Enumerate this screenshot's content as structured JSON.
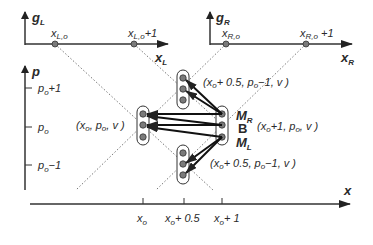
{
  "top_left_axes": {
    "y_label": "g",
    "y_sub": "L",
    "x_label": "x",
    "x_sub": "L",
    "points": [
      {
        "label": "x",
        "sub": "L,o",
        "suffix": ""
      },
      {
        "label": "x",
        "sub": "L,o",
        "suffix": "+1"
      }
    ]
  },
  "top_right_axes": {
    "y_label": "g",
    "y_sub": "R",
    "x_label": "x",
    "x_sub": "R",
    "points": [
      {
        "label": "x",
        "sub": "R,o",
        "suffix": ""
      },
      {
        "label": "x",
        "sub": "R,o",
        "suffix": " +1"
      }
    ]
  },
  "main_axes": {
    "y_label": "p",
    "x_label": "x",
    "y_ticks": [
      {
        "base": "p",
        "sub": "o",
        "suffix": "+1"
      },
      {
        "base": "p",
        "sub": "o",
        "suffix": ""
      },
      {
        "base": "p",
        "sub": "o",
        "suffix": "−1"
      }
    ],
    "x_ticks": [
      {
        "base": "x",
        "sub": "o",
        "suffix": ""
      },
      {
        "base": "x",
        "sub": "o",
        "suffix": "+ 0.5"
      },
      {
        "base": "x",
        "sub": "o",
        "suffix": "+ 1"
      }
    ]
  },
  "nodes": {
    "left": {
      "label_pre": "(x",
      "sub": "o",
      "label_mid": ", p",
      "sub2": "o",
      "label_post": ", v )"
    },
    "upper": {
      "label_pre": "(x",
      "sub": "o",
      "label_mid": "+ 0.5, p",
      "sub2": "o",
      "label_post": "−1, v )"
    },
    "lower": {
      "label_pre": "(x",
      "sub": "o",
      "label_mid": "+ 0.5, p",
      "sub2": "o",
      "label_post": "−1, v )"
    },
    "right": {
      "label_pre": "(x",
      "sub": "o",
      "label_mid": "+1, p",
      "sub2": "o",
      "label_post": ", v )"
    }
  },
  "right_node_labels": {
    "top": {
      "base": "M",
      "sub": "R"
    },
    "middle": {
      "base": "B",
      "sub": ""
    },
    "bottom": {
      "base": "M",
      "sub": "L"
    }
  },
  "colors": {
    "ink": "#2a2a2a",
    "node_fill": "#7a7a7a",
    "background": "#ffffff"
  }
}
